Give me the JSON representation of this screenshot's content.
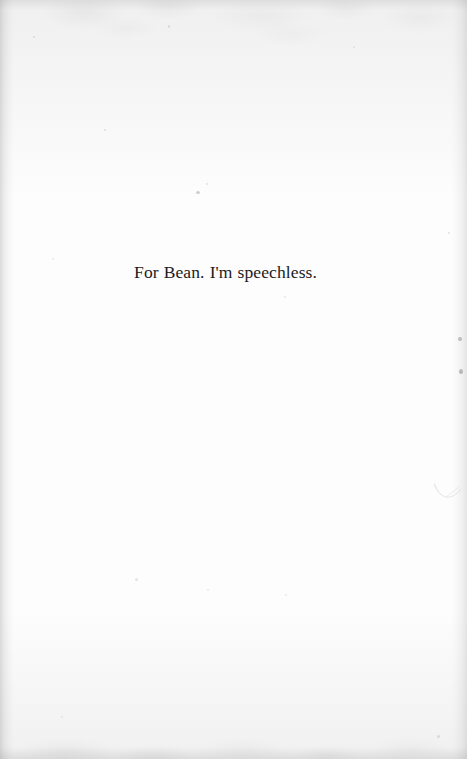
{
  "page": {
    "type": "book-dedication-page",
    "width": 467,
    "height": 759,
    "background_color": "#fefefe",
    "text_color": "#1b1b1f"
  },
  "dedication": {
    "text": "For Bean. I'm speechless.",
    "alignment": "center"
  },
  "artifacts": {
    "specks": [
      {
        "name": "speck-upper-center",
        "x": 196,
        "y": 191,
        "w": 4,
        "h": 3,
        "color": "rgba(150,150,154,0.45)"
      },
      {
        "name": "speck-upper-center-small",
        "x": 206,
        "y": 183,
        "w": 2,
        "h": 2,
        "color": "rgba(160,160,164,0.32)"
      },
      {
        "name": "speck-upper-left",
        "x": 104,
        "y": 129,
        "w": 2,
        "h": 2,
        "color": "rgba(165,165,169,0.30)"
      },
      {
        "name": "speck-top-left",
        "x": 33,
        "y": 36,
        "w": 2,
        "h": 2,
        "color": "rgba(165,165,169,0.28)"
      },
      {
        "name": "speck-top-mid",
        "x": 168,
        "y": 25,
        "w": 2,
        "h": 3,
        "color": "rgba(158,158,162,0.30)"
      },
      {
        "name": "speck-top-right",
        "x": 353,
        "y": 46,
        "w": 2,
        "h": 2,
        "color": "rgba(165,165,169,0.26)"
      },
      {
        "name": "speck-right-upper",
        "x": 458,
        "y": 337,
        "w": 4,
        "h": 4,
        "color": "rgba(140,140,145,0.52)"
      },
      {
        "name": "speck-right-lower",
        "x": 459,
        "y": 369,
        "w": 4,
        "h": 5,
        "color": "rgba(136,136,141,0.55)"
      },
      {
        "name": "speck-right-mid",
        "x": 448,
        "y": 232,
        "w": 2,
        "h": 2,
        "color": "rgba(162,162,166,0.30)"
      },
      {
        "name": "speck-lower-left",
        "x": 135,
        "y": 578,
        "w": 3,
        "h": 3,
        "color": "rgba(162,162,166,0.28)"
      },
      {
        "name": "speck-lower-center",
        "x": 207,
        "y": 589,
        "w": 2,
        "h": 2,
        "color": "rgba(168,168,172,0.24)"
      },
      {
        "name": "speck-lower-right",
        "x": 285,
        "y": 594,
        "w": 2,
        "h": 2,
        "color": "rgba(168,168,172,0.22)"
      },
      {
        "name": "speck-below-text",
        "x": 284,
        "y": 296,
        "w": 2,
        "h": 2,
        "color": "rgba(168,168,172,0.26)"
      },
      {
        "name": "speck-bottom-right",
        "x": 437,
        "y": 735,
        "w": 3,
        "h": 3,
        "color": "rgba(158,158,162,0.30)"
      },
      {
        "name": "speck-bottom-left",
        "x": 61,
        "y": 716,
        "w": 2,
        "h": 2,
        "color": "rgba(168,168,172,0.24)"
      },
      {
        "name": "speck-mid-left",
        "x": 52,
        "y": 258,
        "w": 2,
        "h": 2,
        "color": "rgba(168,168,172,0.24)"
      }
    ],
    "hair_mark": {
      "name": "hair-scratch-right-margin",
      "x": 432,
      "y": 478,
      "color": "rgba(150,150,155,0.60)"
    }
  }
}
